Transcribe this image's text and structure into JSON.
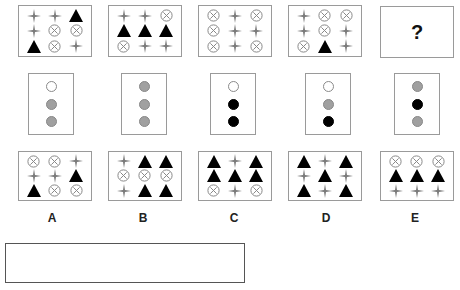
{
  "question_mark": "?",
  "top_row": [
    {
      "cells": [
        "star",
        "star",
        "triangle",
        "star",
        "xcircle",
        "xcircle",
        "triangle",
        "xcircle",
        "star"
      ]
    },
    {
      "cells": [
        "star",
        "star",
        "xcircle",
        "triangle",
        "triangle",
        "triangle",
        "xcircle",
        "star",
        "star"
      ]
    },
    {
      "cells": [
        "xcircle",
        "star",
        "xcircle",
        "xcircle",
        "star",
        "star",
        "xcircle",
        "star",
        "xcircle"
      ]
    },
    {
      "cells": [
        "star",
        "xcircle",
        "xcircle",
        "star",
        "xcircle",
        "star",
        "xcircle",
        "triangle",
        "star"
      ]
    }
  ],
  "middle_row": [
    {
      "dots": [
        "white",
        "gray",
        "gray"
      ]
    },
    {
      "dots": [
        "gray",
        "gray",
        "gray"
      ]
    },
    {
      "dots": [
        "white",
        "black",
        "black"
      ]
    },
    {
      "dots": [
        "white",
        "gray",
        "black"
      ]
    },
    {
      "dots": [
        "gray",
        "black",
        "gray"
      ]
    }
  ],
  "options": [
    {
      "label": "A",
      "cells": [
        "xcircle",
        "xcircle",
        "star",
        "star",
        "star",
        "triangle",
        "triangle",
        "xcircle",
        "xcircle"
      ]
    },
    {
      "label": "B",
      "cells": [
        "star",
        "triangle",
        "triangle",
        "xcircle",
        "xcircle",
        "xcircle",
        "star",
        "triangle",
        "triangle"
      ]
    },
    {
      "label": "C",
      "cells": [
        "triangle",
        "star",
        "triangle",
        "triangle",
        "triangle",
        "triangle",
        "xcircle",
        "star",
        "xcircle"
      ]
    },
    {
      "label": "D",
      "cells": [
        "triangle",
        "star",
        "triangle",
        "star",
        "triangle",
        "star",
        "triangle",
        "star",
        "triangle"
      ]
    },
    {
      "label": "E",
      "cells": [
        "xcircle",
        "xcircle",
        "xcircle",
        "triangle",
        "triangle",
        "triangle",
        "star",
        "star",
        "star"
      ]
    }
  ],
  "answer_box": {
    "value": ""
  }
}
